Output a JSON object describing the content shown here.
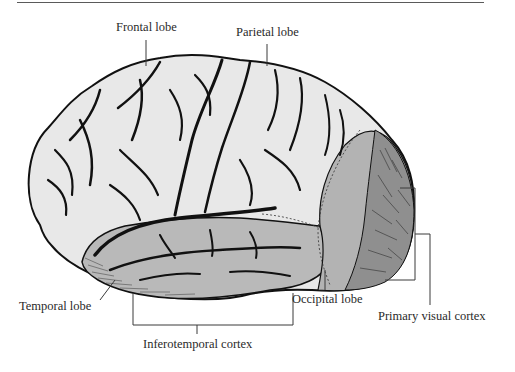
{
  "diagram": {
    "type": "anatomical-illustration",
    "colors": {
      "background": "#ffffff",
      "unshaded_cortex": "#e8e8e8",
      "shaded_region": "#b9b9b9",
      "sulci": "#111111",
      "leader_lines": "#3a3a3a",
      "label_text": "#2a2a2a"
    },
    "labels": [
      {
        "id": "frontal",
        "text": "Frontal lobe",
        "x": 116,
        "y": 21
      },
      {
        "id": "parietal",
        "text": "Parietal lobe",
        "x": 236,
        "y": 26
      },
      {
        "id": "temporal",
        "text": "Temporal lobe",
        "x": 19,
        "y": 304
      },
      {
        "id": "occipital",
        "text": "Occipital lobe",
        "x": 292,
        "y": 296
      },
      {
        "id": "primary-visual",
        "text": "Primary visual cortex",
        "x": 378,
        "y": 313
      },
      {
        "id": "inferotemporal",
        "text": "Inferotemporal cortex",
        "x": 143,
        "y": 340
      }
    ],
    "shaded_regions": [
      "Inferotemporal cortex (temporal lobe)",
      "Occipital lobe",
      "Primary visual cortex"
    ]
  }
}
